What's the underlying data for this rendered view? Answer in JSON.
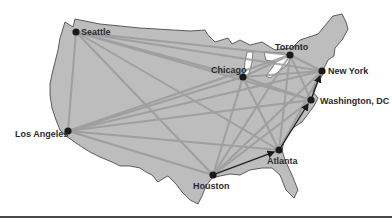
{
  "diagram": {
    "title": "",
    "land_color": "#bdbdbd",
    "outline_color": "#3a3a3a",
    "lake_color": "#ffffff",
    "link_color": "#9a9a9a",
    "route_color": "#1a1a1a",
    "city_color": "#1a1a1a",
    "cities": [
      {
        "id": "seattle",
        "label": "Seattle",
        "x": 76,
        "y": 32
      },
      {
        "id": "chicago",
        "label": "Chicago",
        "x": 243,
        "y": 77
      },
      {
        "id": "toronto",
        "label": "Toronto",
        "x": 290,
        "y": 55
      },
      {
        "id": "newyork",
        "label": "New York",
        "x": 322,
        "y": 71
      },
      {
        "id": "washington",
        "label": "Washington, DC",
        "x": 311,
        "y": 100
      },
      {
        "id": "losangeles",
        "label": "Los Angeles",
        "x": 68,
        "y": 131
      },
      {
        "id": "atlanta",
        "label": "Atlanta",
        "x": 279,
        "y": 150
      },
      {
        "id": "houston",
        "label": "Houston",
        "x": 213,
        "y": 175
      }
    ],
    "highlighted_route": [
      "houston",
      "atlanta",
      "washington",
      "newyork"
    ]
  }
}
